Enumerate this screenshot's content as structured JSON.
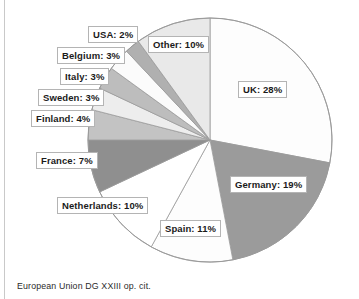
{
  "figure": {
    "caption": "European Union DG XXIII op. cit."
  },
  "chart_data": {
    "type": "pie",
    "title": "",
    "xlabel": "",
    "ylabel": "",
    "legend_position": "none",
    "grid": false,
    "units": "percent",
    "start_angle_deg": 0,
    "direction": "clockwise",
    "center": {
      "x": 210,
      "y": 140
    },
    "radius": 122,
    "categories": [
      "UK",
      "Germany",
      "Spain",
      "Netherlands",
      "France",
      "Finland",
      "Sweden",
      "Italy",
      "Belgium",
      "USA",
      "Other"
    ],
    "values": [
      28,
      19,
      11,
      10,
      7,
      4,
      3,
      3,
      3,
      2,
      10
    ],
    "slices": [
      {
        "label": "UK: 28%",
        "name": "UK",
        "value": 28,
        "color": "#fdfdfd"
      },
      {
        "label": "Germany: 19%",
        "name": "Germany",
        "value": 19,
        "color": "#9b9b9b"
      },
      {
        "label": "Spain: 11%",
        "name": "Spain",
        "value": 11,
        "color": "#fdfdfd"
      },
      {
        "label": "Netherlands: 10%",
        "name": "Netherlands",
        "value": 10,
        "color": "#ffffff"
      },
      {
        "label": "France: 7%",
        "name": "France",
        "value": 7,
        "color": "#8f8f8f"
      },
      {
        "label": "Finland: 4%",
        "name": "Finland",
        "value": 4,
        "color": "#c3c3c3"
      },
      {
        "label": "Sweden: 3%",
        "name": "Sweden",
        "value": 3,
        "color": "#ededed"
      },
      {
        "label": "Italy: 3%",
        "name": "Italy",
        "value": 3,
        "color": "#bdbdbd"
      },
      {
        "label": "Belgium: 3%",
        "name": "Belgium",
        "value": 3,
        "color": "#fbfbfb"
      },
      {
        "label": "USA: 2%",
        "name": "USA",
        "value": 2,
        "color": "#b0b0b0"
      },
      {
        "label": "Other: 10%",
        "name": "Other",
        "value": 10,
        "color": "#e9e9e9"
      }
    ],
    "colors": {
      "outline": "#9a9a9a",
      "label_border": "#b4b4b4",
      "label_fill": "#ffffff",
      "text": "#1b1b1b"
    }
  },
  "labels": [
    {
      "key": "usa",
      "text": "USA: 2%",
      "left": 88,
      "top": 26
    },
    {
      "key": "belgium",
      "text": "Belgium: 3%",
      "left": 57,
      "top": 47
    },
    {
      "key": "italy",
      "text": "Italy: 3%",
      "left": 60,
      "top": 68
    },
    {
      "key": "sweden",
      "text": "Sweden: 3%",
      "left": 38,
      "top": 89
    },
    {
      "key": "finland",
      "text": "Finland: 4%",
      "left": 31,
      "top": 110
    },
    {
      "key": "france",
      "text": "France: 7%",
      "left": 36,
      "top": 152
    },
    {
      "key": "netherlands",
      "text": "Netherlands: 10%",
      "left": 57,
      "top": 197
    },
    {
      "key": "spain",
      "text": "Spain: 11%",
      "left": 160,
      "top": 220
    },
    {
      "key": "germany",
      "text": "Germany: 19%",
      "left": 230,
      "top": 176
    },
    {
      "key": "uk",
      "text": "UK: 28%",
      "left": 238,
      "top": 81
    },
    {
      "key": "other",
      "text": "Other: 10%",
      "left": 148,
      "top": 36
    }
  ]
}
